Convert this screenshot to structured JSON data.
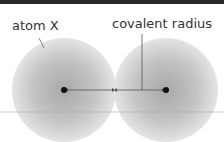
{
  "diagram": {
    "labels": {
      "atom": "atom X",
      "radius": "covalent radius"
    },
    "colors": {
      "atom_fill": "#b0b0b0",
      "border": "#2a2a2a",
      "line": "#555555"
    }
  }
}
